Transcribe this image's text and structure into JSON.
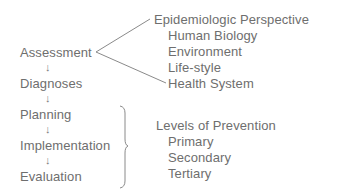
{
  "process_steps": [
    {
      "label": "Assessment"
    },
    {
      "label": "Diagnoses"
    },
    {
      "label": "Planning"
    },
    {
      "label": "Implementation"
    },
    {
      "label": "Evaluation"
    }
  ],
  "arrow_glyph": "↓",
  "epidemiologic": {
    "heading": "Epidemiologic Perspective",
    "items": [
      "Human Biology",
      "Environment",
      "Life-style",
      "Health System"
    ]
  },
  "prevention": {
    "heading": "Levels of Prevention",
    "items": [
      "Primary",
      "Secondary",
      "Tertiary"
    ]
  },
  "colors": {
    "text": "#6e6e6e",
    "line": "#8a8a8a"
  }
}
